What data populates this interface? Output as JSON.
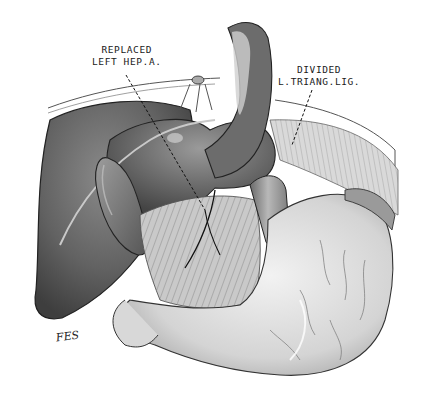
{
  "figure": {
    "type": "anatomical-illustration",
    "style": "grayscale pencil shading",
    "colors": {
      "background": "#ffffff",
      "ink": "#1a1a1a",
      "liver_dark": "#5a5a5a",
      "liver_mid": "#7a7a7a",
      "stomach_light": "#d8d8d8",
      "omentum": "#bdbdbd"
    }
  },
  "labels": {
    "replaced_artery": {
      "line1": "REPLACED",
      "line2": "LEFT HEP.A."
    },
    "triangular_ligament": {
      "line1": "DIVIDED",
      "line2": "L.TRIANG.LIG."
    }
  },
  "signature": "FES"
}
